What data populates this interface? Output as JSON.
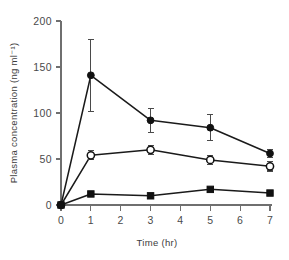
{
  "chart_data": {
    "type": "line",
    "title": "",
    "subtitle": "",
    "xlabel": "Time (hr)",
    "ylabel": "Plasma concentration (ng ml⁻¹)",
    "xlim": [
      0,
      7
    ],
    "ylim": [
      0,
      200
    ],
    "xticks": [
      0,
      1,
      2,
      3,
      4,
      5,
      6,
      7
    ],
    "xticklabels": [
      "0",
      "1",
      "2",
      "3",
      "4",
      "5",
      "6",
      "7"
    ],
    "yticks": [
      0,
      50,
      100,
      150,
      200
    ],
    "yticklabels": [
      "0",
      "50",
      "100",
      "150",
      "200"
    ],
    "grid": false,
    "legend": "none",
    "error_bars": "yes",
    "x": [
      0,
      1,
      3,
      5,
      7
    ],
    "series": [
      {
        "name": "filled-circle-series",
        "marker": "filled-circle",
        "color": "#111111",
        "values": [
          0,
          141,
          92,
          84,
          56
        ],
        "errors": [
          0,
          39,
          13,
          14,
          4
        ]
      },
      {
        "name": "open-circle-series",
        "marker": "open-circle",
        "color": "#111111",
        "values": [
          0,
          54,
          60,
          49,
          42
        ],
        "errors": [
          0,
          5,
          5,
          5,
          5
        ]
      },
      {
        "name": "filled-square-series",
        "marker": "filled-square",
        "color": "#111111",
        "values": [
          0,
          12,
          10,
          17,
          13
        ],
        "errors": [
          0,
          3,
          2,
          2,
          2
        ]
      }
    ]
  },
  "figure": {
    "axis_color": "#6f6f6f",
    "ink_color": "#111111",
    "background": "#ffffff"
  }
}
